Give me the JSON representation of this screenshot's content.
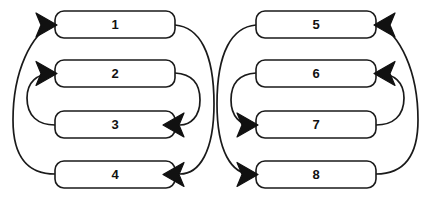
{
  "diagram": {
    "type": "node-link-crossing-diagram",
    "title": "",
    "canvas": {
      "width": 433,
      "height": 205,
      "background": "#ffffff"
    },
    "style": {
      "box_fill": "#ffffff",
      "box_stroke": "#1a1a1a",
      "edge_stroke": "#1a1a1a",
      "arrow_fill": "#111111",
      "label_color": "#111111"
    },
    "groups": [
      {
        "id": "left-group",
        "name": "left-group",
        "arrow_side": "left",
        "nodes": [
          {
            "id": "node-1",
            "label": "1",
            "x": 55,
            "y": 11,
            "w": 120,
            "h": 27
          },
          {
            "id": "node-2",
            "label": "2",
            "x": 55,
            "y": 60,
            "w": 120,
            "h": 27
          },
          {
            "id": "node-3",
            "label": "3",
            "x": 55,
            "y": 111,
            "w": 120,
            "h": 27
          },
          {
            "id": "node-4",
            "label": "4",
            "x": 55,
            "y": 161,
            "w": 120,
            "h": 27
          }
        ],
        "edges": [
          {
            "id": "edge-4-to-1",
            "from": "node-4",
            "to": "node-1",
            "side": "outer-left"
          },
          {
            "id": "edge-3-to-2",
            "from": "node-3",
            "to": "node-2",
            "side": "inner-left"
          },
          {
            "id": "edge-1-to-4",
            "from": "node-1",
            "to": "node-4",
            "side": "outer-right"
          },
          {
            "id": "edge-2-to-3",
            "from": "node-2",
            "to": "node-3",
            "side": "inner-right"
          }
        ]
      },
      {
        "id": "right-group",
        "name": "right-group",
        "arrow_side": "right",
        "nodes": [
          {
            "id": "node-5",
            "label": "5",
            "x": 256,
            "y": 11,
            "w": 120,
            "h": 27
          },
          {
            "id": "node-6",
            "label": "6",
            "x": 256,
            "y": 60,
            "w": 120,
            "h": 27
          },
          {
            "id": "node-7",
            "label": "7",
            "x": 256,
            "y": 111,
            "w": 120,
            "h": 27
          },
          {
            "id": "node-8",
            "label": "8",
            "x": 256,
            "y": 161,
            "w": 120,
            "h": 27
          }
        ],
        "edges": [
          {
            "id": "edge-8-to-5",
            "from": "node-8",
            "to": "node-5",
            "side": "outer-right"
          },
          {
            "id": "edge-7-to-6",
            "from": "node-7",
            "to": "node-6",
            "side": "inner-right"
          },
          {
            "id": "edge-5-to-8",
            "from": "node-5",
            "to": "node-8",
            "side": "outer-left"
          },
          {
            "id": "edge-6-to-7",
            "from": "node-6",
            "to": "node-7",
            "side": "inner-left"
          }
        ]
      }
    ]
  }
}
